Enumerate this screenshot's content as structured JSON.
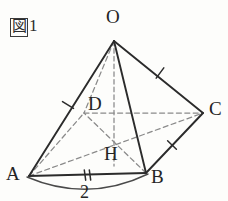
{
  "figure": {
    "caption": "図1",
    "caption_boxed_char": "図",
    "caption_number": "1",
    "colors": {
      "solid_edge": "#2b2b2b",
      "hidden_edge": "#8a8a8a",
      "arc": "#4a4a4a",
      "label_text": "#242424",
      "background": "#fdfdfb"
    },
    "labels": {
      "apex": "O",
      "vertex_a": "A",
      "vertex_b": "B",
      "vertex_c": "C",
      "vertex_d": "D",
      "foot": "H",
      "edge_length_ab": "2"
    },
    "geometry": {
      "points": {
        "O": [
          114,
          41
        ],
        "A": [
          29,
          176
        ],
        "B": [
          146,
          173
        ],
        "C": [
          203,
          113
        ],
        "D": [
          84,
          113
        ],
        "H": [
          114,
          155
        ]
      },
      "solid_edges": [
        [
          "O",
          "A"
        ],
        [
          "O",
          "B"
        ],
        [
          "O",
          "C"
        ],
        [
          "A",
          "B"
        ],
        [
          "B",
          "C"
        ]
      ],
      "hidden_edges": [
        [
          "O",
          "D"
        ],
        [
          "A",
          "D"
        ],
        [
          "D",
          "C"
        ],
        [
          "O",
          "H"
        ],
        [
          "A",
          "C"
        ],
        [
          "B",
          "D"
        ]
      ],
      "tick_marks": [
        {
          "edge": "OA",
          "count": 1
        },
        {
          "edge": "OC",
          "count": 1
        },
        {
          "edge": "BC",
          "count": 1
        },
        {
          "edge": "AB",
          "count": 2
        }
      ],
      "arc": {
        "from": "A",
        "to": "B",
        "label": "2"
      }
    }
  }
}
